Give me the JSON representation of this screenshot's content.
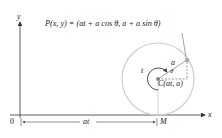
{
  "diagram": {
    "point_label": "P(x, y) = (at + a cos θ, a + a sin θ)",
    "center_label": "C(at, a)",
    "radius_label": "a",
    "angle_label": "θ",
    "arc_label": "t",
    "origin_label": "0",
    "distance_label": "at",
    "contact_label": "M",
    "x_axis_label": "x",
    "y_axis_label": "y"
  },
  "colors": {
    "axis": "#333333",
    "circle": "#c8c8c8",
    "point": "#a8a8a8",
    "center": "#888888",
    "text": "#222222"
  }
}
